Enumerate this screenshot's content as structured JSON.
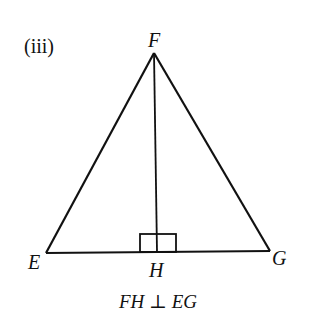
{
  "figure": {
    "part_label": "(iii)",
    "caption": "FH ⊥ EG",
    "vertices": {
      "F": {
        "label": "F"
      },
      "E": {
        "label": "E"
      },
      "G": {
        "label": "G"
      },
      "H": {
        "label": "H"
      }
    },
    "segments": [
      "FE",
      "FG",
      "EG",
      "FH"
    ],
    "right_angle_at": "H",
    "line_color": "#111111"
  }
}
